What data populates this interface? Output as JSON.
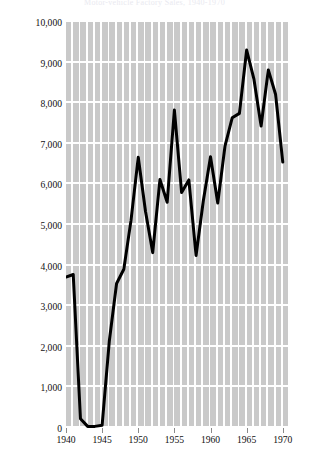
{
  "figure": {
    "title_faint": "Motor-vehicle Factory Sales, 1940-1970"
  },
  "axes": {
    "ylabel": "Motor-vehicle Factory Sales: Number of Passenger Cars (in thousands)",
    "xlabel": "",
    "yticklabels": [
      "10,000",
      "9,000",
      "8,000",
      "7,000",
      "6,000",
      "5,000",
      "4,000",
      "3,000",
      "2,000",
      "1,000",
      "0"
    ],
    "xticklabels": [
      "1940",
      "1945",
      "1950",
      "1955",
      "1960",
      "1965",
      "1970"
    ]
  },
  "chart_data": {
    "type": "line",
    "title": "Motor-vehicle Factory Sales, 1940-1970",
    "xlabel": "",
    "ylabel": "Motor-vehicle Factory Sales: Number of Passenger Cars (in thousands)",
    "xlim": [
      1940,
      1971
    ],
    "ylim": [
      0,
      10000
    ],
    "xticks": [
      1940,
      1945,
      1950,
      1955,
      1960,
      1965,
      1970
    ],
    "yticks": [
      0,
      1000,
      2000,
      3000,
      4000,
      5000,
      6000,
      7000,
      8000,
      9000,
      10000
    ],
    "grid": true,
    "legend": "none",
    "line_color": "#000000",
    "line_width": 3,
    "plot_background": "#c9c9c9",
    "gridline_color": "#ffffff",
    "series": [
      {
        "name": "Passenger cars produced (thousands)",
        "x": [
          1940,
          1941,
          1942,
          1943,
          1944,
          1945,
          1946,
          1947,
          1948,
          1949,
          1950,
          1951,
          1952,
          1953,
          1954,
          1955,
          1956,
          1957,
          1958,
          1959,
          1960,
          1961,
          1962,
          1963,
          1964,
          1965,
          1966,
          1967,
          1968,
          1969,
          1970
        ],
        "values": [
          3720,
          3780,
          230,
          40,
          40,
          70,
          2150,
          3560,
          3910,
          5120,
          6670,
          5340,
          4320,
          6120,
          5560,
          7830,
          5800,
          6110,
          4250,
          5590,
          6680,
          5540,
          6940,
          7640,
          7750,
          9310,
          8600,
          7440,
          8820,
          8220,
          6550
        ]
      }
    ],
    "annotations": [
      {
        "text": "World War II production halt",
        "x_range": [
          1942,
          1945
        ]
      },
      {
        "text": "Peak",
        "x": 1965,
        "y": 9310
      }
    ]
  }
}
